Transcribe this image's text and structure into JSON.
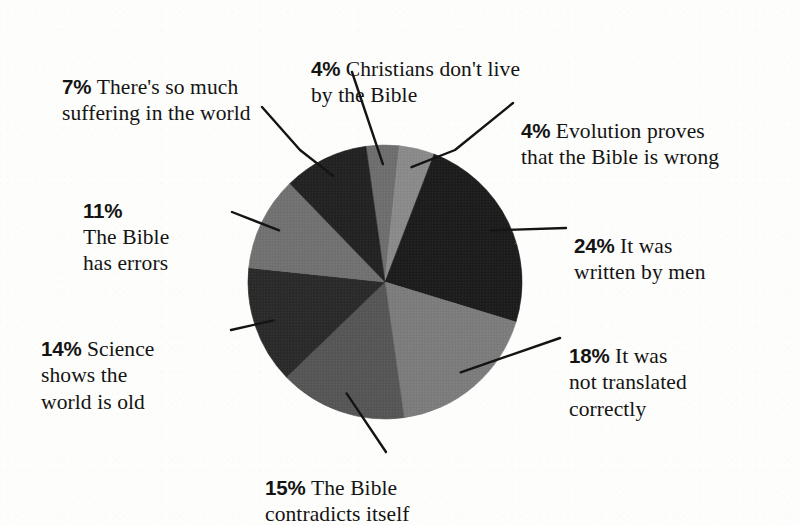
{
  "chart_data": {
    "type": "pie",
    "title": "",
    "subtitle": "",
    "xlabel": "",
    "ylabel": "",
    "legend_position": "callout-labels",
    "grid": false,
    "units": "percent",
    "total_labeled": 97,
    "categories": [
      "Christians don't live by the Bible",
      "Evolution proves that the Bible is wrong",
      "It was written by men",
      "It was not translated correctly",
      "The Bible contradicts itself",
      "Science shows the world is old",
      "The Bible has errors",
      "There's so much suffering in the world"
    ],
    "values": [
      4,
      4,
      24,
      18,
      15,
      14,
      11,
      7
    ],
    "slices": [
      {
        "id": "christians",
        "percent_label": "4%",
        "value": 4,
        "text": "Christians don't live\nby the Bible",
        "fill": "#6e6e6e",
        "start_angle": 352,
        "end_angle": 366
      },
      {
        "id": "evolution",
        "percent_label": "4%",
        "value": 4,
        "text": "Evolution proves\nthat the Bible is wrong",
        "fill": "#8a8a8a",
        "start_angle": 366,
        "end_angle": 381
      },
      {
        "id": "written-by-men",
        "percent_label": "24%",
        "value": 24,
        "text": "It was\nwritten by men",
        "fill": "#1b1b1b",
        "start_angle": 381,
        "end_angle": 467
      },
      {
        "id": "not-translated",
        "percent_label": "18%",
        "value": 18,
        "text": "It was\nnot translated\ncorrectly",
        "fill": "#7c7c7c",
        "start_angle": 467,
        "end_angle": 532
      },
      {
        "id": "contradicts",
        "percent_label": "15%",
        "value": 15,
        "text": "The Bible\ncontradicts itself",
        "fill": "#565656",
        "start_angle": 532,
        "end_angle": 586
      },
      {
        "id": "science",
        "percent_label": "14%",
        "value": 14,
        "text": "Science\nshows the\nworld is old",
        "fill": "#2a2a2a",
        "start_angle": 586,
        "end_angle": 636
      },
      {
        "id": "bible-errors",
        "percent_label": "11%",
        "value": 11,
        "text": "The Bible\nhas errors",
        "fill": "#717171",
        "start_angle": 636,
        "end_angle": 676
      },
      {
        "id": "suffering",
        "percent_label": "7%",
        "value": 7,
        "text": "There's so much\nsuffering in the world",
        "fill": "#232323",
        "start_angle": 676,
        "end_angle": 712
      }
    ],
    "geometry": {
      "center_x": 385,
      "center_y": 282,
      "radius": 137
    },
    "colors": {
      "background": "#fdfdfb",
      "ink": "#141414",
      "darkest_slice": "#1b1b1b",
      "lightest_slice": "#8a8a8a"
    }
  },
  "labels": {
    "christians": {
      "pct": "4%",
      "text": "Christians don't live\nby the Bible"
    },
    "evolution": {
      "pct": "4%",
      "text": "Evolution proves\nthat the Bible is wrong"
    },
    "written": {
      "pct": "24%",
      "text": "It was\nwritten by men"
    },
    "translated": {
      "pct": "18%",
      "text": "It was\nnot translated\ncorrectly"
    },
    "contradict": {
      "pct": "15%",
      "text": "The Bible\ncontradicts itself"
    },
    "science": {
      "pct": "14%",
      "text": "Science\nshows the\nworld is old"
    },
    "errors": {
      "pct": "11%",
      "text": "The Bible\nhas errors"
    },
    "suffering": {
      "pct": "7%",
      "text": "There's so much\nsuffering in the world"
    }
  }
}
